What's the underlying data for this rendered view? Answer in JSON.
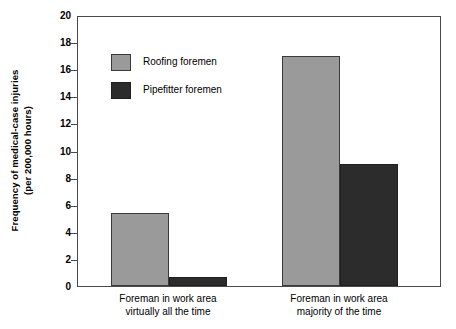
{
  "chart_data": {
    "type": "bar",
    "title": "",
    "xlabel": "",
    "ylabel": "Frequency of medical-case injuries\n(per 200,000 hours)",
    "ylabel_line1": "Frequency of medical-case injuries",
    "ylabel_line2": "(per 200,000 hours)",
    "ylim": [
      0,
      20
    ],
    "ytick_step": 2,
    "yticks": [
      20,
      18,
      16,
      14,
      12,
      10,
      8,
      6,
      4,
      2,
      0
    ],
    "ytick_labels": [
      "20",
      "18",
      "16",
      "14",
      "12",
      "10",
      "8",
      "6",
      "4",
      "2",
      "0"
    ],
    "grid": false,
    "legend_position": "inside-upper-left",
    "categories": [
      "Foreman in work area virtually all the time",
      "Foreman in work area majority of the time"
    ],
    "category_lines": [
      [
        "Foreman in work area",
        "virtually all the time"
      ],
      [
        "Foreman in work area",
        "majority of the time"
      ]
    ],
    "series": [
      {
        "name": "Roofing foremen",
        "color": "#9a9a9a",
        "values": [
          5.4,
          17.0
        ]
      },
      {
        "name": "Pipefitter foremen",
        "color": "#2c2c2c",
        "values": [
          0.7,
          9.0
        ]
      }
    ]
  },
  "legend": {
    "items": [
      {
        "label": "Roofing foremen",
        "swatch": "legend-swatch-roofing"
      },
      {
        "label": "Pipefitter foremen",
        "swatch": "legend-swatch-pipefitter"
      }
    ]
  },
  "colors": {
    "series_roofing": "#9a9a9a",
    "series_pipefitter": "#2c2c2c",
    "axis": "#4a4a4a",
    "background": "#ffffff",
    "text": "#000000"
  }
}
